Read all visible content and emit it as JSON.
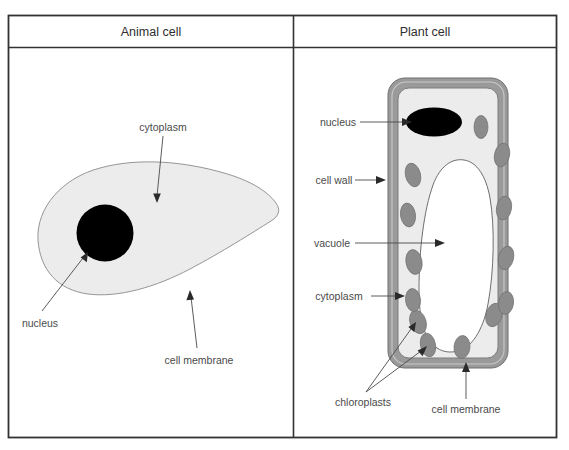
{
  "figure": {
    "columns": [
      {
        "header": "Animal cell"
      },
      {
        "header": "Plant cell"
      }
    ]
  },
  "animal_cell": {
    "labels": [
      {
        "id": "cytoplasm",
        "text": "cytoplasm"
      },
      {
        "id": "nucleus",
        "text": "nucleus"
      },
      {
        "id": "cell-membrane",
        "text": "cell membrane"
      }
    ],
    "parts": [
      {
        "id": "cytoplasm-body",
        "name": "cytoplasm",
        "fill": "#ececec"
      },
      {
        "id": "nucleus-body",
        "name": "nucleus",
        "fill": "#000000"
      }
    ]
  },
  "plant_cell": {
    "labels": [
      {
        "id": "nucleus",
        "text": "nucleus"
      },
      {
        "id": "cell-wall",
        "text": "cell wall"
      },
      {
        "id": "vacuole",
        "text": "vacuole"
      },
      {
        "id": "cytoplasm",
        "text": "cytoplasm"
      },
      {
        "id": "chloroplasts",
        "text": "chloroplasts"
      },
      {
        "id": "cell-membrane",
        "text": "cell membrane"
      }
    ],
    "parts": [
      {
        "id": "cell-wall-body",
        "name": "cell wall",
        "fill": "#9a9a9a"
      },
      {
        "id": "cytoplasm-body",
        "name": "cytoplasm",
        "fill": "#ececec"
      },
      {
        "id": "vacuole-body",
        "name": "vacuole",
        "fill": "#ffffff"
      },
      {
        "id": "nucleus-body",
        "name": "nucleus",
        "fill": "#000000"
      },
      {
        "id": "chloroplast-body",
        "name": "chloroplast",
        "fill": "#8b8b8b"
      }
    ],
    "chloroplast_count": 13
  },
  "colors": {
    "border": "#333333",
    "cytoplasm": "#ececec",
    "cell_wall": "#9a9a9a",
    "chloroplast": "#8b8b8b",
    "nucleus": "#000000",
    "vacuole": "#ffffff",
    "label_text": "#4a4a4a",
    "header_text": "#2e2e2e",
    "leader_line": "#4a4a4a",
    "outline": "#707070"
  }
}
